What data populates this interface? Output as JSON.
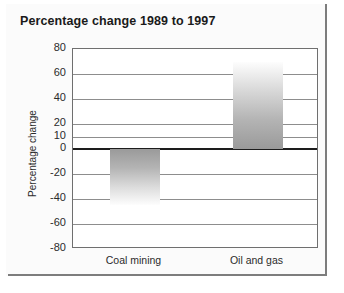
{
  "chart_data": {
    "type": "bar",
    "title": "Percentage change 1989 to 1997",
    "xlabel": "",
    "ylabel": "Percentage change",
    "categories": [
      "Coal mining",
      "Oil and gas"
    ],
    "values": [
      -45,
      70
    ],
    "ylim": [
      -80,
      80
    ],
    "ytick_labels": [
      "80",
      "60",
      "40",
      "20",
      "10",
      "0",
      "-20",
      "-40",
      "-60",
      "-80"
    ],
    "ytick_values": [
      80,
      60,
      40,
      20,
      10,
      0,
      -20,
      -40,
      -60,
      -80
    ],
    "grid": true,
    "legend": "none",
    "zero_line_value": 0,
    "series": [
      {
        "name": "Percentage change",
        "values": [
          -45,
          70
        ]
      }
    ],
    "bar_fill": "grey-vertical-gradient"
  },
  "colors": {
    "zero_line": "#1d1d1d",
    "gridline": "#8d8d8d",
    "plot_border": "#6f6f6f",
    "frame_edge": "#7d7d7d",
    "text": "#2b2b2b",
    "title_text": "#1a1a1a",
    "bar_light": "#fdfdfd",
    "bar_dark": "#9a9a9a",
    "card_background": "#fbfbfb",
    "plot_background": "#ffffff"
  }
}
